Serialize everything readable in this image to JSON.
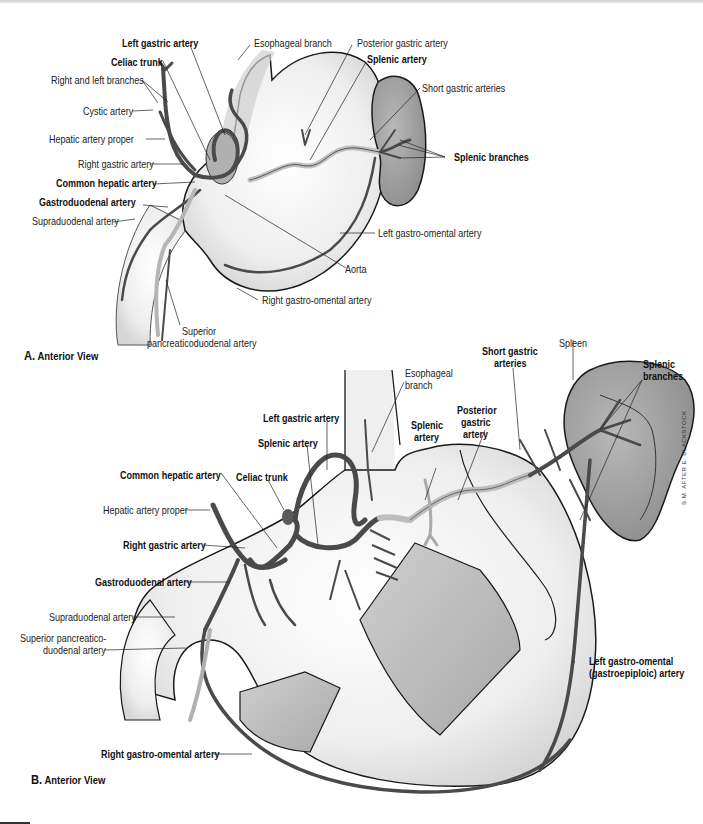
{
  "figure": {
    "panel_a": {
      "letter": "A.",
      "title": "Anterior View",
      "labels": {
        "left_gastric_artery": "Left gastric artery",
        "celiac_trunk": "Celiac trunk",
        "right_and_left_branches": "Right and left branches",
        "cystic_artery": "Cystic artery",
        "hepatic_artery_proper": "Hepatic artery proper",
        "right_gastric_artery": "Right gastric artery",
        "common_hepatic_artery": "Common hepatic artery",
        "gastroduodenal_artery": "Gastroduodenal artery",
        "supraduodenal_artery": "Supraduodenal artery",
        "esophageal_branch": "Esophageal branch",
        "posterior_gastric_artery": "Posterior gastric artery",
        "splenic_artery": "Splenic artery",
        "short_gastric_arteries": "Short gastric arteries",
        "splenic_branches": "Splenic branches",
        "left_gastro_omental_artery": "Left gastro-omental artery",
        "aorta": "Aorta",
        "right_gastro_omental_artery": "Right gastro-omental artery",
        "superior_pd_line1": "Superior",
        "superior_pd_line2": "pancreaticoduodenal artery"
      }
    },
    "panel_b": {
      "letter": "B.",
      "title": "Anterior View",
      "labels": {
        "esophageal_branch_line1": "Esophageal",
        "esophageal_branch_line2": "branch",
        "short_gastric_line1": "Short gastric",
        "short_gastric_line2": "arteries",
        "spleen": "Spleen",
        "splenic_branches_line1": "Splenic",
        "splenic_branches_line2": "branches",
        "left_gastric_artery": "Left gastric artery",
        "splenic_artery_left": "Splenic artery",
        "splenic_artery_mid_line1": "Splenic",
        "splenic_artery_mid_line2": "artery",
        "posterior_gastric_line1": "Posterior",
        "posterior_gastric_line2": "gastric",
        "posterior_gastric_line3": "artery",
        "common_hepatic_artery": "Common hepatic artery",
        "celiac_trunk": "Celiac trunk",
        "hepatic_artery_proper": "Hepatic artery proper",
        "right_gastric_artery": "Right gastric artery",
        "gastroduodenal_artery": "Gastroduodenal artery",
        "supraduodenal_artery": "Supraduodenal artery",
        "superior_pd_line1": "Superior pancreatico-",
        "superior_pd_line2": "duodenal artery",
        "left_go_line1": "Left gastro-omental",
        "left_go_line2": "(gastroepiploic) artery",
        "right_gastro_omental_artery": "Right gastro-omental artery"
      },
      "signature": "S.M. AFTER E. BLACKSTOCK"
    },
    "colors": {
      "artery": "#4a4a4a",
      "stomach_fill": "#ececec",
      "spleen_fill": "#9a9a9a",
      "window_fill": "#bdbdbd",
      "outline": "#1a1a1a"
    }
  }
}
